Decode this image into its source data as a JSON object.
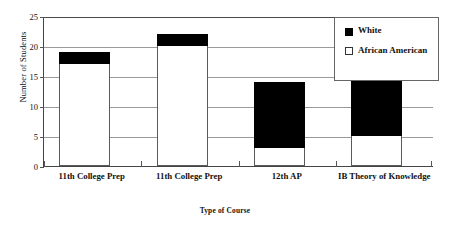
{
  "chart_data": {
    "type": "bar",
    "subtype": "stacked-column",
    "title": "",
    "xlabel": "Type of Course",
    "ylabel": "Number of Students",
    "categories": [
      "11th College Prep",
      "11th College Prep",
      "12th AP",
      "IB Theory of Knowledge"
    ],
    "series": [
      {
        "name": "African American",
        "values": [
          17,
          20,
          3,
          5
        ],
        "color": "#ffffff"
      },
      {
        "name": "White",
        "values": [
          2,
          2,
          11,
          18
        ],
        "color": "#000000"
      }
    ],
    "totals": [
      19,
      22,
      14,
      23
    ],
    "ylim": [
      0,
      25
    ],
    "yticks": [
      0,
      5,
      10,
      15,
      20,
      25
    ],
    "ytick_labels": [
      "0",
      "5",
      "10",
      "15",
      "20",
      "25"
    ],
    "grid": true,
    "grid_axis": "y",
    "legend_position": "top-right",
    "legend": [
      {
        "label": "White",
        "swatch": "filled-square"
      },
      {
        "label": "African American",
        "swatch": "hollow-square"
      }
    ]
  },
  "axes": {
    "y_title": "Number of Students",
    "x_title": "Type of Course"
  }
}
